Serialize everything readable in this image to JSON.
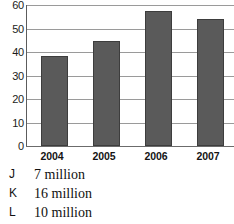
{
  "chart_data": {
    "type": "bar",
    "title": "",
    "xlabel": "",
    "ylabel": "",
    "categories": [
      "2004",
      "2005",
      "2006",
      "2007"
    ],
    "values": [
      38.5,
      44.5,
      57.5,
      54
    ],
    "ylim": [
      0,
      60
    ],
    "yticks": [
      0,
      10,
      20,
      30,
      40,
      50,
      60
    ],
    "ytick_labels": [
      "0",
      "10",
      "20",
      "30",
      "40",
      "50",
      "60"
    ],
    "grid": true,
    "legend": "none",
    "bar_color": "#5a5a5a",
    "bar_edge_color": "#3d3d3d",
    "gridline_color": "#9a9a9a",
    "axis_color": "#5c5c5c",
    "background": "#ffffff"
  },
  "answer_options": [
    {
      "letter": "J",
      "text": "7 million"
    },
    {
      "letter": "K",
      "text": "16 million"
    },
    {
      "letter": "L",
      "text": "10 million"
    }
  ]
}
